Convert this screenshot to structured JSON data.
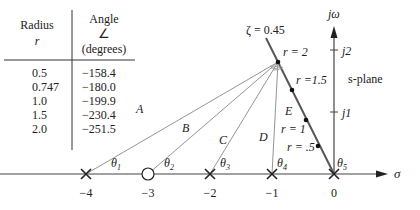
{
  "table": {
    "headers": {
      "radius": "Radius",
      "radius_symbol": "r",
      "angle": "Angle",
      "angle_symbol": "∠",
      "angle_unit": "(degrees)"
    },
    "rows": [
      {
        "r": "0.5",
        "angle": "−158.4"
      },
      {
        "r": "0.747",
        "angle": "−180.0"
      },
      {
        "r": "1.0",
        "angle": "−199.9"
      },
      {
        "r": "1.5",
        "angle": "−230.4"
      },
      {
        "r": "2.0",
        "angle": "−251.5"
      }
    ]
  },
  "plane": {
    "label": "s-plane",
    "imag_axis": "jω",
    "real_axis": "σ",
    "zeta_label": "ζ = 0.45",
    "imag_ticks": [
      "j1",
      "j2"
    ],
    "real_ticks": [
      "−4",
      "−3",
      "−2",
      "−1",
      "0"
    ]
  },
  "vectors": [
    "A",
    "B",
    "C",
    "D",
    "E"
  ],
  "angles": [
    "θ1",
    "θ2",
    "θ3",
    "θ4",
    "θ5"
  ],
  "locus_points": [
    {
      "label": "r = 2"
    },
    {
      "label": "r =1.5"
    },
    {
      "label": "r = 1"
    },
    {
      "label": "r = .5"
    }
  ],
  "poles": [
    "−4",
    "−2",
    "−1",
    "0"
  ],
  "zeros": [
    "−3"
  ]
}
